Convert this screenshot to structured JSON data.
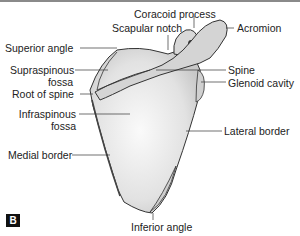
{
  "figure": {
    "panel_label": "B",
    "labels": {
      "coracoid_process": "Coracoid process",
      "scapular_notch": "Scapular notch",
      "acromion": "Acromion",
      "superior_angle": "Superior angle",
      "supraspinous_fossa_1": "Supraspinous",
      "supraspinous_fossa_2": "fossa",
      "spine": "Spine",
      "glenoid_cavity": "Glenoid cavity",
      "root_of_spine": "Root of spine",
      "infraspinous_fossa_1": "Infraspinous",
      "infraspinous_fossa_2": "fossa",
      "lateral_border": "Lateral  border",
      "medial_border": "Medial border",
      "inferior_angle": "Inferior angle"
    },
    "colors": {
      "bone_fill": "#e4e4e4",
      "bone_outline": "#333333",
      "text": "#222222",
      "badge_bg": "#111111",
      "top_bar": "#8a8a8a"
    }
  }
}
